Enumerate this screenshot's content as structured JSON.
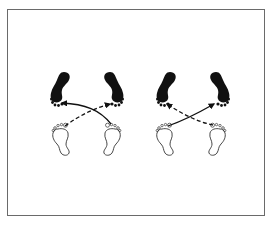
{
  "figure": {
    "type": "footwork-diagram",
    "frame_color": "#6a6a6a",
    "background": "#ffffff",
    "panels": [
      {
        "id": "left",
        "start_feet": {
          "style": "outline",
          "positions": [
            "bottom-left",
            "bottom-right"
          ]
        },
        "end_feet": {
          "style": "filled",
          "positions": [
            "top-left",
            "top-right"
          ]
        },
        "arrows": [
          {
            "from": "bottom-right",
            "to": "top-left",
            "style": "solid"
          },
          {
            "from": "bottom-left",
            "to": "top-right",
            "style": "dashed"
          }
        ]
      },
      {
        "id": "right",
        "start_feet": {
          "style": "outline",
          "positions": [
            "bottom-left",
            "bottom-right"
          ]
        },
        "end_feet": {
          "style": "filled",
          "positions": [
            "top-left",
            "top-right"
          ]
        },
        "arrows": [
          {
            "from": "bottom-left",
            "to": "top-right",
            "style": "solid"
          },
          {
            "from": "bottom-right",
            "to": "top-left",
            "style": "dashed"
          }
        ]
      }
    ],
    "colors": {
      "ink": "#111111",
      "outline": "#333333"
    }
  }
}
